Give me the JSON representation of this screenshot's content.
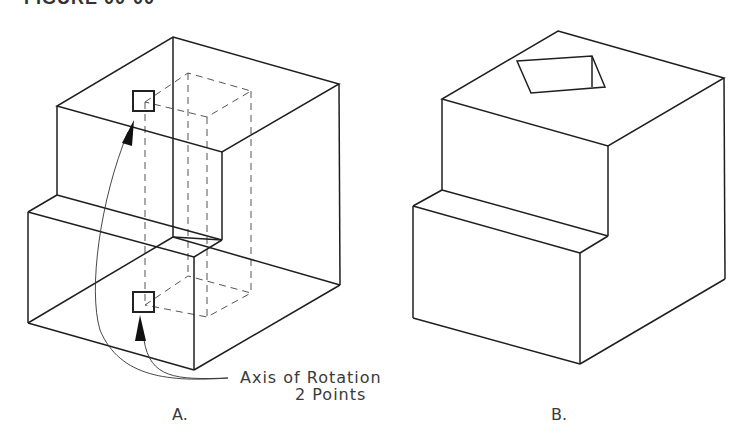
{
  "figure": {
    "title": "FIGURE 00-00",
    "panels": [
      {
        "id": "A",
        "label": "A.",
        "description": "Stepped block with hidden rectangular prism, two pick points defining the axis of rotation",
        "annotation": {
          "line1": "Axis of Rotation",
          "line2": "2 Points"
        }
      },
      {
        "id": "B",
        "label": "B.",
        "description": "Stepped block after rotation, rectangular opening visible on top face"
      }
    ]
  }
}
